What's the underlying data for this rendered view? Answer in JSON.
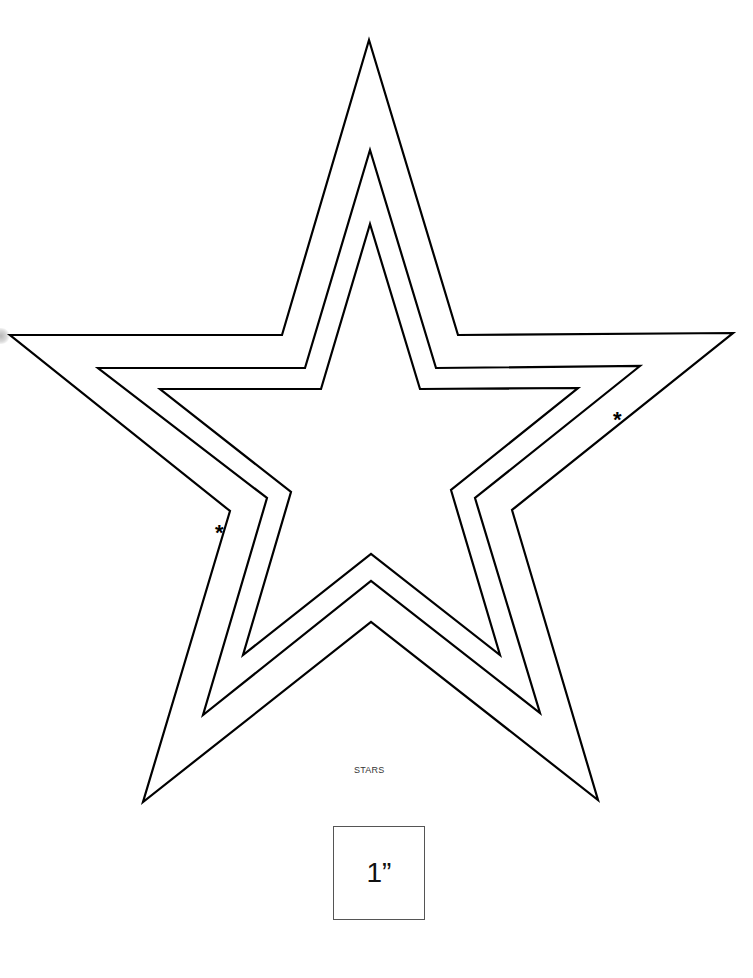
{
  "document": {
    "caption": "STARS",
    "scale_label": "1”",
    "marker_left": "*",
    "marker_right": "*"
  },
  "shapes": {
    "stroke_color": "#000000",
    "stars": [
      {
        "name": "outer-star",
        "points": "369,40 458,335 733,333 512,510 598,800 371,622 143,802 230,511 10,335 282,335"
      },
      {
        "name": "middle-star",
        "points": "370,150 436,368 640,366 475,498 540,713 371,581 203,715 267,498 98,368 305,368"
      },
      {
        "name": "inner-star",
        "points": "370,224 420,389 578,388 451,490 500,655 371,554 243,655 291,492 160,389 321,389"
      }
    ]
  }
}
